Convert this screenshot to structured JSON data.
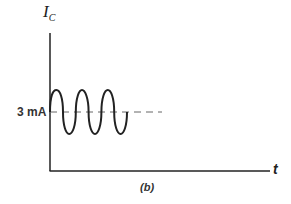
{
  "figure": {
    "caption": "(b)",
    "y_axis_label": "I",
    "y_axis_subscript": "C",
    "x_axis_label": "t",
    "dc_level_label": "3 mA",
    "colors": {
      "line": "#222222",
      "dashed": "#666666",
      "background": "#ffffff"
    }
  },
  "diagram": {
    "type": "ac-signal-on-dc-level",
    "cycles": 3
  }
}
